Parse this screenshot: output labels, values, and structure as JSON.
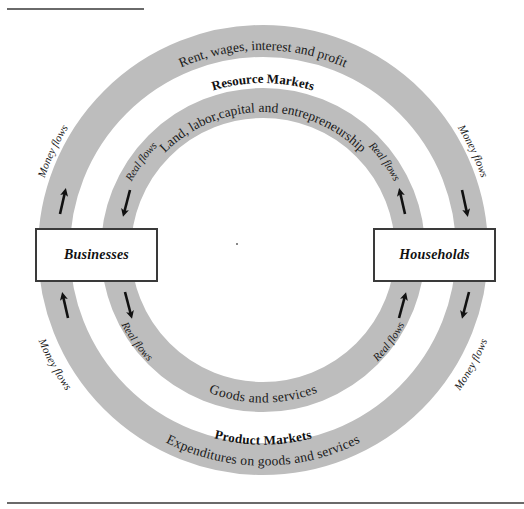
{
  "diagram": {
    "colors": {
      "ring": "#bdbdbd",
      "box_border": "#3a3a3a",
      "arrow": "#111111",
      "rule": "#6a6a6a"
    },
    "nodes": {
      "businesses": "Businesses",
      "households": "Households"
    },
    "markets": {
      "resource": "Resource Markets",
      "product": "Product Markets"
    },
    "outer_ring": {
      "top_label": "Rent, wages, interest and profit",
      "bottom_label": "Expenditures on goods and services",
      "flow_labels": [
        "Money flows",
        "Money flows",
        "Money flows",
        "Money flows"
      ]
    },
    "inner_ring": {
      "top_label": "Land, labor,capital and entrepreneurship",
      "bottom_label": "Goods and services",
      "flow_labels": [
        "Real flows",
        "Real flows",
        "Real flows",
        "Real flows"
      ]
    },
    "arrows": [
      {
        "ring": "outer",
        "side": "left-upper",
        "direction": "up"
      },
      {
        "ring": "outer",
        "side": "left-lower",
        "direction": "up"
      },
      {
        "ring": "outer",
        "side": "right-upper",
        "direction": "down"
      },
      {
        "ring": "outer",
        "side": "right-lower",
        "direction": "down"
      },
      {
        "ring": "inner",
        "side": "left-upper",
        "direction": "down"
      },
      {
        "ring": "inner",
        "side": "left-lower",
        "direction": "down"
      },
      {
        "ring": "inner",
        "side": "right-upper",
        "direction": "up"
      },
      {
        "ring": "inner",
        "side": "right-lower",
        "direction": "up"
      }
    ]
  }
}
